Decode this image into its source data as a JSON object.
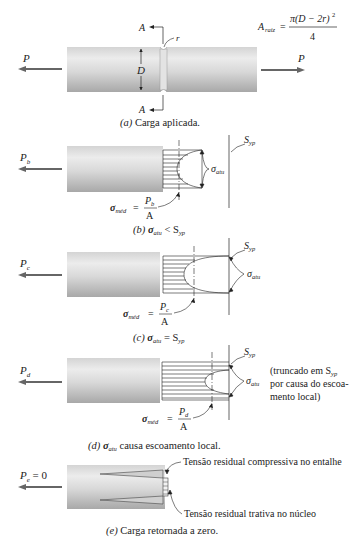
{
  "figure": {
    "panels": [
      {
        "id": "a",
        "caption_letter": "(a)",
        "caption_text": " Carga aplicada.",
        "load_label": "P",
        "load_label_right": "P",
        "section_label_top": "A",
        "section_label_bottom": "A",
        "notch_radius_label": "r",
        "diameter_label": "D",
        "area_formula": {
          "lhs": "A",
          "lhs_sub": "raiz",
          "numerator": "π(D − 2r)",
          "numerator_exp": "2",
          "denominator": "4"
        }
      },
      {
        "id": "b",
        "caption_letter": "(b)",
        "caption_sigma": "σ",
        "caption_sigma_sub": "atu",
        "caption_rel": " < S",
        "caption_rel_sub": "yp",
        "load_label": "P",
        "load_sub": "b",
        "syp_label": "S",
        "syp_sub": "yp",
        "sigma_atu_label": "σ",
        "sigma_atu_sub": "atu",
        "sigma_med": "σ",
        "sigma_med_sub": "méd",
        "eq": "=",
        "frac_num": "P",
        "frac_num_sub": "b",
        "frac_den": "A"
      },
      {
        "id": "c",
        "caption_letter": "(c)",
        "caption_sigma": "σ",
        "caption_sigma_sub": "atu",
        "caption_rel": " = S",
        "caption_rel_sub": "yp",
        "load_label": "P",
        "load_sub": "c",
        "syp_label": "S",
        "syp_sub": "yp",
        "sigma_atu_label": "σ",
        "sigma_atu_sub": "atu",
        "sigma_med": "σ",
        "sigma_med_sub": "méd",
        "eq": "=",
        "frac_num": "P",
        "frac_num_sub": "c",
        "frac_den": "A"
      },
      {
        "id": "d",
        "caption_letter": "(d)",
        "caption_sigma": "σ",
        "caption_sigma_sub": "atu",
        "caption_rel": " causa escoamento local.",
        "load_label": "P",
        "load_sub": "d",
        "syp_label": "S",
        "syp_sub": "yp",
        "sigma_atu_label": "σ",
        "sigma_atu_sub": "atu",
        "sigma_med": "σ",
        "sigma_med_sub": "méd",
        "eq": "=",
        "frac_num": "P",
        "frac_num_sub": "d",
        "frac_den": "A",
        "note_line1": "(truncado em S",
        "note_line1_sub": "yp",
        "note_line2": "por causa do escoa-",
        "note_line3": "mento local)"
      },
      {
        "id": "e",
        "caption_letter": "(e)",
        "caption_text": " Carga retornada a zero.",
        "load_label": "P",
        "load_sub": "e",
        "load_value": " = 0",
        "annotation_top": "Tensão residual compressiva no entalhe",
        "annotation_bottom": "Tensão residual trativa no núcleo"
      }
    ],
    "colors": {
      "ink": "#222222",
      "bar_light": "#e6e6e6",
      "bar_dark": "#a9a9a9",
      "arrow": "#555555"
    }
  }
}
